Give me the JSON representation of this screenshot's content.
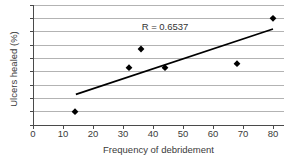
{
  "chart_data": {
    "type": "scatter",
    "title": "",
    "xlabel": "Frequency of debridement",
    "ylabel": "Ulcers healed (%)",
    "annotation": "R = 0.6537",
    "x_ticks": [
      0,
      10,
      20,
      30,
      40,
      50,
      60,
      70,
      80
    ],
    "xlim": [
      0,
      83.7
    ],
    "ylim": [
      0,
      90
    ],
    "y_grid_step": 10,
    "y_tick_labels_visible": false,
    "grid": "horizontal",
    "legend": "none",
    "points": [
      {
        "x": 14,
        "y": 10
      },
      {
        "x": 32,
        "y": 43
      },
      {
        "x": 36,
        "y": 57
      },
      {
        "x": 44,
        "y": 43
      },
      {
        "x": 68,
        "y": 46
      },
      {
        "x": 80,
        "y": 80
      }
    ],
    "trendline": {
      "x1": 14.3,
      "y1": 23,
      "x2": 80,
      "y2": 72
    },
    "colors": {
      "point": "#000000",
      "line": "#000000",
      "grid": "#b3b3b3",
      "axis": "#4a4a4a",
      "text": "#3a3a3a",
      "background": "#ffffff"
    }
  }
}
